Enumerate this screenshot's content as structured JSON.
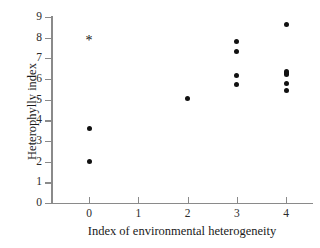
{
  "chart_data": {
    "type": "scatter",
    "title": "",
    "xlabel": "Index of environmental heterogeneity",
    "ylabel": "Heterophylly index",
    "xlim": [
      -0.75,
      4.5
    ],
    "ylim": [
      0,
      9
    ],
    "xticks": [
      0,
      1,
      2,
      3,
      4
    ],
    "yticks": [
      0,
      1,
      2,
      3,
      4,
      5,
      6,
      7,
      8,
      9
    ],
    "xtick_labels": [
      "0",
      "1",
      "2",
      "3",
      "4"
    ],
    "ytick_labels": [
      "0",
      "1",
      "2",
      "3",
      "4",
      "5",
      "6",
      "7",
      "8",
      "9"
    ],
    "grid": false,
    "legend": null,
    "marker_color": "#111111",
    "axis_color": "#8a8a8a",
    "background": "#ffffff",
    "series": [
      {
        "name": "observations",
        "marker": "circle",
        "points": [
          {
            "x": 0,
            "y": 3.6
          },
          {
            "x": 0,
            "y": 2.0
          },
          {
            "x": 2,
            "y": 5.05
          },
          {
            "x": 3,
            "y": 7.8
          },
          {
            "x": 3,
            "y": 7.35
          },
          {
            "x": 3,
            "y": 6.15
          },
          {
            "x": 3,
            "y": 5.75
          },
          {
            "x": 4,
            "y": 8.65
          },
          {
            "x": 4,
            "y": 6.35,
            "overlapping": true
          },
          {
            "x": 4,
            "y": 6.2,
            "overlapping": true
          },
          {
            "x": 4,
            "y": 5.8
          },
          {
            "x": 4,
            "y": 5.45
          }
        ]
      },
      {
        "name": "outlier-annotation",
        "marker": "asterisk",
        "points": [
          {
            "x": 0,
            "y": 7.85,
            "label": "*"
          }
        ]
      }
    ],
    "annotations": [
      {
        "x": 0,
        "y": 7.85,
        "text": "*",
        "note": "asterisk marker at index 0"
      }
    ]
  }
}
